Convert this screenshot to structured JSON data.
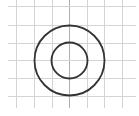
{
  "diagram": {
    "type": "concentric-circles-on-grid",
    "background": "#ffffff",
    "grid": {
      "color": "#d4d4d4",
      "axis_color": "#b0b0b0",
      "vertical_x": [
        16,
        34,
        52,
        69,
        87,
        104,
        122
      ],
      "horizontal_y": [
        6,
        25,
        43,
        60,
        78,
        96
      ],
      "x_start": 8,
      "x_end": 136,
      "y_start": 0,
      "y_end": 108
    },
    "center": {
      "x": 69,
      "y": 60
    },
    "circles": [
      {
        "name": "outer-circle",
        "r": 35,
        "stroke": "#333333",
        "stroke_width": 1.8
      },
      {
        "name": "inner-circle",
        "r": 18,
        "stroke": "#333333",
        "stroke_width": 1.8
      }
    ]
  }
}
